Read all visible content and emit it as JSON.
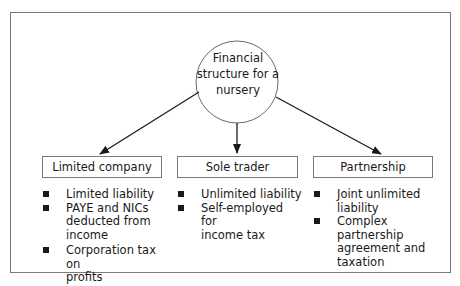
{
  "diagram": {
    "center": {
      "lines": [
        "Financial",
        "structure for a",
        "nursery"
      ]
    },
    "branches": [
      {
        "title": "Limited company",
        "points": [
          "Limited liability",
          "PAYE and NICs deducted from income",
          "Corporation tax on profits"
        ],
        "lines": [
          [
            "Limited liability"
          ],
          [
            "PAYE and NICs",
            "deducted from",
            "income"
          ],
          [
            "Corporation tax on",
            "profits"
          ]
        ]
      },
      {
        "title": "Sole trader",
        "points": [
          "Unlimited liability",
          "Self-employed for income tax"
        ],
        "lines": [
          [
            "Unlimited liability"
          ],
          [
            "Self-employed for",
            "income tax"
          ]
        ]
      },
      {
        "title": "Partnership",
        "points": [
          "Joint unlimited liability",
          "Complex partnership agreement and taxation"
        ],
        "lines": [
          [
            "Joint unlimited",
            "liability"
          ],
          [
            "Complex",
            "partnership",
            "agreement and",
            "taxation"
          ]
        ]
      }
    ],
    "colors": {
      "border": "#7a7a7a",
      "text": "#1a1a1a",
      "arrow": "#1a1a1a"
    }
  }
}
